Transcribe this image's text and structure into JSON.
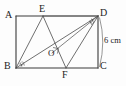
{
  "figure": {
    "type": "geometry-diagram",
    "shape": "rectangle",
    "stroke_color": "#3a3a3a",
    "label_color": "#1c1c1c",
    "background_color": "#fdfdfd"
  },
  "vertices": {
    "A": {
      "label": "A",
      "x": 16,
      "y": 16,
      "position": "top-left"
    },
    "B": {
      "label": "B",
      "x": 16,
      "y": 68,
      "position": "bottom-left"
    },
    "C": {
      "label": "C",
      "x": 98,
      "y": 68,
      "position": "bottom-right"
    },
    "D": {
      "label": "D",
      "x": 98,
      "y": 16,
      "position": "top-right"
    },
    "E": {
      "label": "E",
      "x": 43,
      "y": 16,
      "position": "on-top-edge"
    },
    "F": {
      "label": "F",
      "x": 66,
      "y": 68,
      "position": "on-bottom-edge"
    },
    "O": {
      "label": "O",
      "x": 55,
      "y": 50,
      "position": "interior-intersection"
    }
  },
  "segments": [
    {
      "name": "AD",
      "from": "A",
      "to": "D",
      "kind": "rectangle-side"
    },
    {
      "name": "DC",
      "from": "D",
      "to": "C",
      "kind": "rectangle-side"
    },
    {
      "name": "CB",
      "from": "C",
      "to": "B",
      "kind": "rectangle-side"
    },
    {
      "name": "BA",
      "from": "B",
      "to": "A",
      "kind": "rectangle-side"
    },
    {
      "name": "BE",
      "from": "B",
      "to": "E",
      "kind": "cevian"
    },
    {
      "name": "EF",
      "from": "E",
      "to": "F",
      "kind": "cevian"
    },
    {
      "name": "BD",
      "from": "B",
      "to": "D",
      "kind": "diagonal"
    },
    {
      "name": "DF",
      "from": "D",
      "to": "F",
      "kind": "cevian"
    },
    {
      "name": "DE",
      "from": "D",
      "to": "E",
      "kind": "cevian"
    }
  ],
  "marks": {
    "right_angle_at_O": {
      "shown": true,
      "at": "O"
    },
    "angle_ticks_at_B": {
      "shown": true,
      "at": "B",
      "count": 2
    },
    "angle_ticks_at_D": {
      "shown": true,
      "at": "D",
      "count": 2
    }
  },
  "dimensions": [
    {
      "name": "side-DC",
      "label": "6 cm",
      "value": 6,
      "unit": "cm",
      "side": "right",
      "measures": "DC"
    }
  ],
  "labels": {
    "A": "A",
    "B": "B",
    "C": "C",
    "D": "D",
    "E": "E",
    "F": "F",
    "O": "O",
    "dimension_right": "6 cm"
  }
}
